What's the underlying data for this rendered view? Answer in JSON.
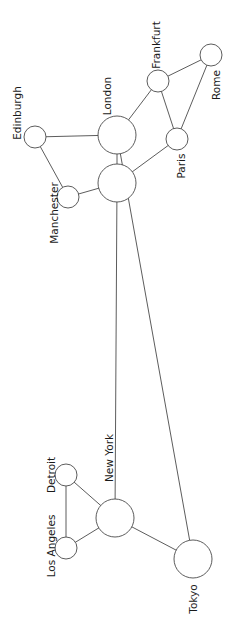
{
  "diagram": {
    "type": "network-graph",
    "orientation": "rotated -90deg (labels read bottom-to-top)",
    "colors": {
      "stroke": "#4a4a4a",
      "node_fill": "#ffffff",
      "text": "#1a1a1a",
      "background": "#ffffff"
    },
    "nodes": [
      {
        "id": "edinburgh",
        "label": "Edinburgh",
        "cx": 35,
        "cy": 137,
        "r": 11,
        "lx": 18,
        "ly": 113
      },
      {
        "id": "manchester",
        "label": "Manchester",
        "cx": 68,
        "cy": 197,
        "r": 11,
        "lx": 55,
        "ly": 213
      },
      {
        "id": "london",
        "label": "London",
        "cx": 117,
        "cy": 135,
        "r": 19,
        "lx": 108,
        "ly": 96
      },
      {
        "id": "unlabeled_hub",
        "label": "",
        "cx": 117,
        "cy": 183,
        "r": 19,
        "lx": 0,
        "ly": 0
      },
      {
        "id": "frankfurt",
        "label": "Frankfurt",
        "cx": 158,
        "cy": 81,
        "r": 11,
        "lx": 157,
        "ly": 45
      },
      {
        "id": "paris",
        "label": "Paris",
        "cx": 177,
        "cy": 139,
        "r": 11,
        "lx": 182,
        "ly": 166
      },
      {
        "id": "rome",
        "label": "Rome",
        "cx": 211,
        "cy": 55,
        "r": 11,
        "lx": 217,
        "ly": 85
      },
      {
        "id": "detroit",
        "label": "Detroit",
        "cx": 66,
        "cy": 475,
        "r": 11,
        "lx": 52,
        "ly": 475
      },
      {
        "id": "new_york",
        "label": "New York",
        "cx": 115,
        "cy": 518,
        "r": 19,
        "lx": 110,
        "ly": 458
      },
      {
        "id": "los_angeles",
        "label": "Los Angeles",
        "cx": 66,
        "cy": 548,
        "r": 11,
        "lx": 52,
        "ly": 546
      },
      {
        "id": "tokyo",
        "label": "Tokyo",
        "cx": 193,
        "cy": 559,
        "r": 19,
        "lx": 194,
        "ly": 599
      }
    ],
    "edges": [
      {
        "from": "edinburgh",
        "to": "london"
      },
      {
        "from": "edinburgh",
        "to": "manchester"
      },
      {
        "from": "manchester",
        "to": "unlabeled_hub"
      },
      {
        "from": "london",
        "to": "unlabeled_hub"
      },
      {
        "from": "london",
        "to": "frankfurt"
      },
      {
        "from": "frankfurt",
        "to": "rome"
      },
      {
        "from": "frankfurt",
        "to": "paris"
      },
      {
        "from": "rome",
        "to": "paris"
      },
      {
        "from": "paris",
        "to": "unlabeled_hub"
      },
      {
        "from": "unlabeled_hub",
        "to": "new_york"
      },
      {
        "from": "london",
        "to": "tokyo"
      },
      {
        "from": "new_york",
        "to": "detroit"
      },
      {
        "from": "new_york",
        "to": "los_angeles"
      },
      {
        "from": "detroit",
        "to": "los_angeles"
      },
      {
        "from": "new_york",
        "to": "tokyo"
      }
    ]
  }
}
